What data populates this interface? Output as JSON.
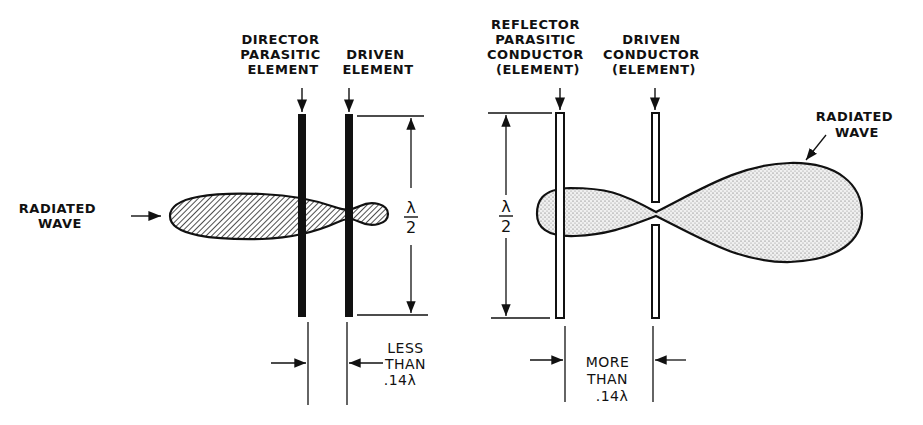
{
  "diagram": {
    "left": {
      "title": "Director parasitic array",
      "labels": {
        "director": [
          "DIRECTOR",
          "PARASITIC",
          "ELEMENT"
        ],
        "driven": [
          "DRIVEN",
          "ELEMENT"
        ],
        "radiated_wave": [
          "RADIATED",
          "WAVE"
        ],
        "height_numerator": "λ",
        "height_denominator": "2",
        "spacing": [
          "LESS",
          "THAN",
          ".14λ"
        ]
      },
      "lobe_fill": "hatched"
    },
    "right": {
      "title": "Reflector parasitic array",
      "labels": {
        "reflector": [
          "REFLECTOR",
          "PARASITIC",
          "CONDUCTOR",
          "(ELEMENT)"
        ],
        "driven": [
          "DRIVEN",
          "CONDUCTOR",
          "(ELEMENT)"
        ],
        "radiated_wave": [
          "RADIATED",
          "WAVE"
        ],
        "height_numerator": "λ",
        "height_denominator": "2",
        "spacing": [
          "MORE",
          "THAN",
          ".14λ"
        ]
      },
      "lobe_fill": "stippled"
    },
    "colors": {
      "ink": "#111111",
      "background": "#ffffff",
      "stipple": "#d9d9d9"
    }
  }
}
